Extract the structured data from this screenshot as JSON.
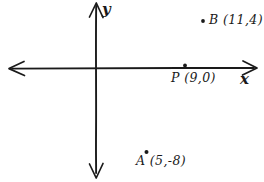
{
  "figure": {
    "kind": "hand-drawn-cartesian-plane",
    "background_color": "#ffffff",
    "ink_color": "#1a1a1a"
  },
  "axes": {
    "x_axis_label": "x",
    "y_axis_label": "y",
    "x_axis": {
      "arrowheads": "both",
      "y_pixel": 68,
      "from_x": 8,
      "to_x": 256
    },
    "y_axis": {
      "arrowheads": "both",
      "x_pixel": 96,
      "from_y": 3,
      "to_y": 178
    },
    "origin": {
      "x_pixel": 96,
      "y_pixel": 68
    },
    "gridlines": false,
    "tick_labels": []
  },
  "points": [
    {
      "name": "B",
      "label": "B (11,4)",
      "coordinates": [
        11,
        4
      ],
      "dot_pixel": {
        "x": 203,
        "y": 21
      },
      "quadrant": "I"
    },
    {
      "name": "P",
      "label": "P (9,0)",
      "coordinates": [
        9,
        0
      ],
      "dot_pixel": {
        "x": 185,
        "y": 66
      },
      "quadrant": "on-x-axis"
    },
    {
      "name": "A",
      "label": "A (5,-8)",
      "coordinates": [
        5,
        -8
      ],
      "dot_pixel": {
        "x": 146,
        "y": 152
      },
      "quadrant": "IV"
    }
  ],
  "labels": {
    "b_text": "B (11,4)",
    "p_text": "P (9,0)",
    "a_text": "A (5,-8)",
    "x_text": "x",
    "y_text": "y"
  }
}
